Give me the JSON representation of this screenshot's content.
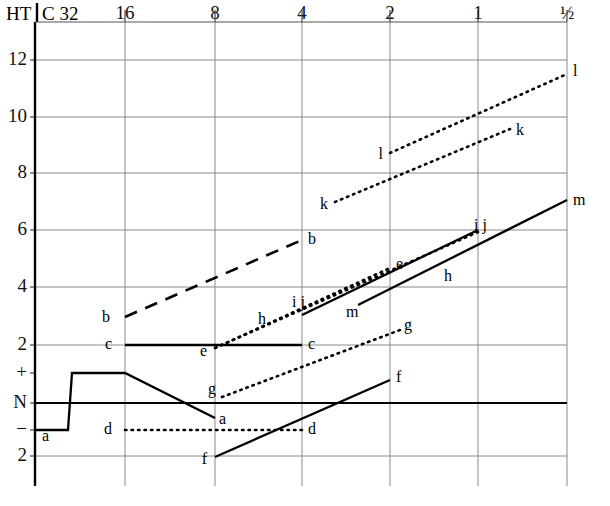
{
  "chart_data": {
    "type": "line",
    "title": "",
    "xlabel": "",
    "ylabel": "",
    "header_left": "HT",
    "header_right": "C 32",
    "x_axis": {
      "name": "frequency-axis",
      "position": "top",
      "tick_labels": [
        "32",
        "16",
        "8",
        "4",
        "2",
        "1",
        "½"
      ],
      "tick_px": [
        35,
        125,
        215,
        302,
        390,
        478,
        567
      ]
    },
    "y_axis": {
      "name": "hearing-threshold-axis",
      "position": "left",
      "tick_labels": [
        "12",
        "10",
        "8",
        "6",
        "4",
        "2",
        "+",
        "N",
        "−",
        "2"
      ],
      "tick_px": [
        60,
        117,
        173,
        230,
        287,
        345,
        373,
        403,
        430,
        456
      ],
      "grid": true
    },
    "grid": {
      "vertical_px": [
        125,
        215,
        302,
        390,
        478,
        567
      ],
      "horizontal_px": [
        60,
        117,
        173,
        230,
        287,
        345,
        403,
        456
      ],
      "baseline_label": "N"
    },
    "series": [
      {
        "name": "a",
        "style": "solid",
        "label_points": [
          "a",
          "a"
        ],
        "points": [
          [
            35,
            430
          ],
          [
            68,
            430
          ],
          [
            72,
            373
          ],
          [
            125,
            373
          ],
          [
            215,
            418
          ]
        ]
      },
      {
        "name": "b",
        "style": "dashed",
        "label_points": [
          "b",
          "b"
        ],
        "points": [
          [
            125,
            317
          ],
          [
            302,
            240
          ]
        ]
      },
      {
        "name": "c",
        "style": "solid",
        "label_points": [
          "c",
          "c"
        ],
        "points": [
          [
            125,
            345
          ],
          [
            302,
            345
          ]
        ]
      },
      {
        "name": "d",
        "style": "dotted",
        "label_points": [
          "d",
          "d"
        ],
        "points": [
          [
            125,
            430
          ],
          [
            302,
            430
          ]
        ]
      },
      {
        "name": "e",
        "style": "dotted",
        "label_points": [
          "e",
          "e"
        ],
        "points": [
          [
            215,
            348
          ],
          [
            390,
            268
          ]
        ]
      },
      {
        "name": "f",
        "style": "solid",
        "label_points": [
          "f",
          "f"
        ],
        "points": [
          [
            215,
            457
          ],
          [
            390,
            380
          ]
        ]
      },
      {
        "name": "g",
        "style": "dotted",
        "label_points": [
          "g",
          "g"
        ],
        "points": [
          [
            222,
            397
          ],
          [
            400,
            330
          ]
        ]
      },
      {
        "name": "h",
        "style": "dotted",
        "label_points": [
          "h",
          "h"
        ],
        "points": [
          [
            215,
            348
          ],
          [
            478,
            232
          ]
        ]
      },
      {
        "name": "ij",
        "style": "solid",
        "label_points": [
          "i j",
          "i j"
        ],
        "points": [
          [
            302,
            315
          ],
          [
            478,
            230
          ]
        ]
      },
      {
        "name": "k",
        "style": "dotted",
        "label_points": [
          "k",
          "k"
        ],
        "points": [
          [
            335,
            202
          ],
          [
            510,
            129
          ]
        ]
      },
      {
        "name": "l",
        "style": "dotted",
        "label_points": [
          "l",
          "l"
        ],
        "points": [
          [
            390,
            153
          ],
          [
            567,
            74
          ]
        ]
      },
      {
        "name": "m",
        "style": "solid",
        "label_points": [
          "m",
          "m"
        ],
        "points": [
          [
            358,
            305
          ],
          [
            567,
            200
          ]
        ]
      }
    ],
    "annotations": [
      {
        "text": "b",
        "x": 110,
        "y": 318,
        "anchor": "right"
      },
      {
        "text": "b",
        "x": 308,
        "y": 240,
        "anchor": "left"
      },
      {
        "text": "c",
        "x": 112,
        "y": 345,
        "anchor": "right"
      },
      {
        "text": "c",
        "x": 308,
        "y": 345,
        "anchor": "left"
      },
      {
        "text": "a",
        "x": 42,
        "y": 437,
        "anchor": "left"
      },
      {
        "text": "a",
        "x": 219,
        "y": 420,
        "anchor": "left"
      },
      {
        "text": "d",
        "x": 112,
        "y": 430,
        "anchor": "right"
      },
      {
        "text": "d",
        "x": 308,
        "y": 430,
        "anchor": "left"
      },
      {
        "text": "e",
        "x": 207,
        "y": 352,
        "anchor": "right"
      },
      {
        "text": "e",
        "x": 396,
        "y": 265,
        "anchor": "left"
      },
      {
        "text": "f",
        "x": 207,
        "y": 460,
        "anchor": "right"
      },
      {
        "text": "f",
        "x": 396,
        "y": 378,
        "anchor": "left"
      },
      {
        "text": "g",
        "x": 216,
        "y": 390,
        "anchor": "right"
      },
      {
        "text": "g",
        "x": 404,
        "y": 326,
        "anchor": "left"
      },
      {
        "text": "h",
        "x": 258,
        "y": 320,
        "anchor": "left"
      },
      {
        "text": "h",
        "x": 444,
        "y": 277,
        "anchor": "left"
      },
      {
        "text": "i j",
        "x": 292,
        "y": 303,
        "anchor": "left"
      },
      {
        "text": "i j",
        "x": 474,
        "y": 226,
        "anchor": "left"
      },
      {
        "text": "k",
        "x": 328,
        "y": 205,
        "anchor": "right"
      },
      {
        "text": "k",
        "x": 516,
        "y": 131,
        "anchor": "left"
      },
      {
        "text": "l",
        "x": 383,
        "y": 155,
        "anchor": "right"
      },
      {
        "text": "l",
        "x": 573,
        "y": 72,
        "anchor": "left"
      },
      {
        "text": "m",
        "x": 346,
        "y": 313,
        "anchor": "left"
      },
      {
        "text": "m",
        "x": 573,
        "y": 201,
        "anchor": "left"
      }
    ]
  },
  "header": {
    "ht": "HT",
    "c32": "C 32"
  },
  "x_ticks": [
    {
      "label": "32",
      "x": 35
    },
    {
      "label": "16",
      "x": 125
    },
    {
      "label": "8",
      "x": 215
    },
    {
      "label": "4",
      "x": 302
    },
    {
      "label": "2",
      "x": 390
    },
    {
      "label": "1",
      "x": 478
    },
    {
      "label": "½",
      "x": 567
    }
  ],
  "y_ticks": [
    {
      "label": "12",
      "y": 60
    },
    {
      "label": "10",
      "y": 117
    },
    {
      "label": "8",
      "y": 173
    },
    {
      "label": "6",
      "y": 230
    },
    {
      "label": "4",
      "y": 287
    },
    {
      "label": "2",
      "y": 345
    },
    {
      "label": "+",
      "y": 373
    },
    {
      "label": "N",
      "y": 403
    },
    {
      "label": "−",
      "y": 430
    },
    {
      "label": "2",
      "y": 456
    }
  ]
}
